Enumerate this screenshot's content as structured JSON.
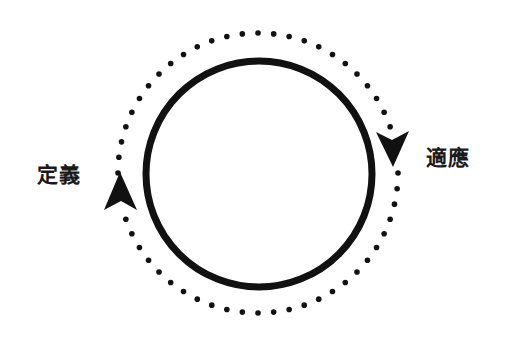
{
  "diagram": {
    "type": "cycle",
    "labels": {
      "left": "定義",
      "right": "適應"
    },
    "inner_circle": {
      "cx": 259,
      "cy": 174,
      "r": 113,
      "stroke_width": 7,
      "style": "solid"
    },
    "outer_circle": {
      "cx": 258,
      "cy": 173,
      "r": 140,
      "style": "dotted",
      "dot_radius": 2.8,
      "dot_count": 56
    },
    "arrows": [
      {
        "position": "left",
        "direction": "up",
        "tip": [
          120,
          172
        ]
      },
      {
        "position": "right",
        "direction": "down",
        "tip": [
          393,
          167
        ]
      }
    ],
    "colors": {
      "stroke": "#111111",
      "background": "#ffffff"
    }
  }
}
